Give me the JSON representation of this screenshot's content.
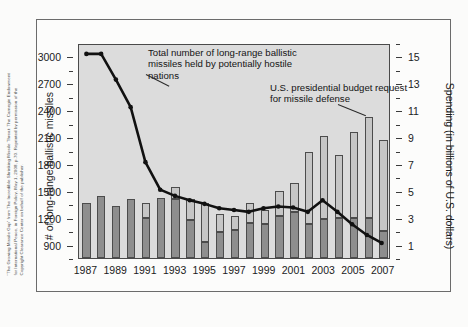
{
  "credit": "\"The Growing Missile Gap\" from The Incredible Shrinking Missile Threat: The Carnegie Endowment for International Peace, in Foreign Policy, May 1, 2008, p.70. Reprinted by permission of the Copyright Clearance Center on behalf of the publisher.",
  "annotations": {
    "missiles": "Total number of long-range ballistic missiles held by potentially hostile nations",
    "budget": "U.S. presidential budget request for missile defense"
  },
  "colors": {
    "panel_background": "#dcdcdc",
    "bar_dark": "#8e8e8e",
    "bar_light": "#c6c6c6",
    "line": "#111111",
    "axis": "#3b3b3b",
    "frame": "#6b6b6b"
  },
  "chart_data": {
    "type": "bar",
    "title": "",
    "xlabel": "",
    "ylabel": "# of long-range ballistic missiles",
    "ylabel_right": "Spending (in billions of U.S. dollars)",
    "grid": false,
    "legend": "none",
    "x": [
      1987,
      1988,
      1989,
      1990,
      1991,
      1992,
      1993,
      1994,
      1995,
      1996,
      1997,
      1998,
      1999,
      2000,
      2001,
      2002,
      2003,
      2004,
      2005,
      2006,
      2007
    ],
    "xtick_labels": [
      "1987",
      "1989",
      "1991",
      "1993",
      "1995",
      "1997",
      "1999",
      "2001",
      "2003",
      "2005",
      "2007"
    ],
    "xtick_values": [
      1987,
      1989,
      1991,
      1993,
      1995,
      1997,
      1999,
      2001,
      2003,
      2005,
      2007
    ],
    "ylim_left": [
      750,
      3150
    ],
    "ytick_left": [
      900,
      1200,
      1500,
      1800,
      2100,
      2400,
      2700,
      3000
    ],
    "ylim_right": [
      0,
      16
    ],
    "ytick_right": [
      1,
      3,
      5,
      7,
      9,
      11,
      13,
      15
    ],
    "series": [
      {
        "name": "U.S. presidential budget request for missile defense",
        "axis": "right",
        "type": "bar",
        "unit": "billions of U.S. dollars",
        "values": [
          4.1,
          4.6,
          3.9,
          4.4,
          4.1,
          4.5,
          5.3,
          4.4,
          4.1,
          3.3,
          3.1,
          4.1,
          3.6,
          5.0,
          5.6,
          7.9,
          9.1,
          7.7,
          9.4,
          10.5,
          8.8
        ],
        "segments_top_light": [
          0,
          0,
          0,
          0,
          1.1,
          0,
          0.9,
          1.6,
          2.9,
          1.4,
          1.0,
          1.5,
          1.1,
          1.9,
          2.2,
          5.4,
          6.2,
          4.7,
          6.4,
          7.5,
          6.8
        ]
      },
      {
        "name": "Total number of long-range ballistic missiles held by potentially hostile nations",
        "axis": "left",
        "type": "line",
        "unit": "missiles",
        "values": [
          3050,
          3050,
          2760,
          2450,
          1830,
          1520,
          1450,
          1400,
          1360,
          1310,
          1290,
          1270,
          1310,
          1330,
          1320,
          1270,
          1400,
          1270,
          1130,
          1010,
          920
        ]
      }
    ]
  }
}
